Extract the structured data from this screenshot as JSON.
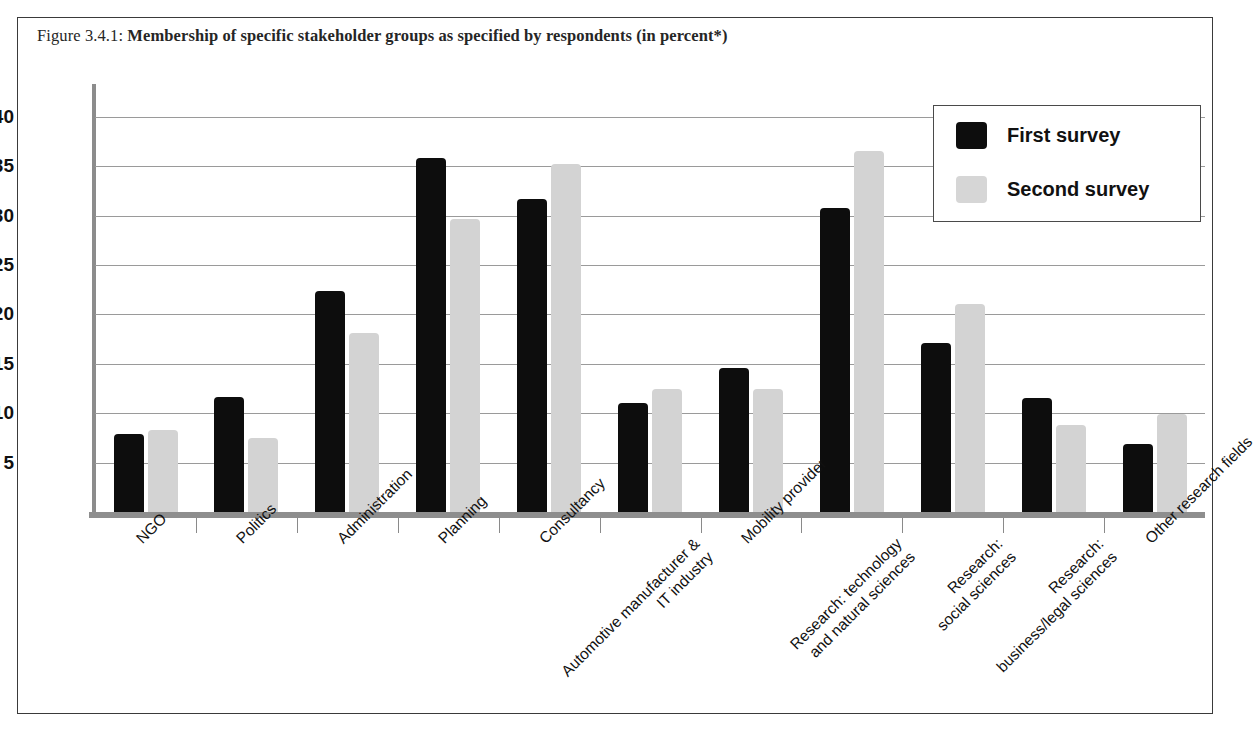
{
  "figure": {
    "caption_prefix": "Figure 3.4.1: ",
    "caption_main": "Membership of specific stakeholder groups as specified by respondents (in percent*)"
  },
  "legend": {
    "position": "top-right",
    "entries": [
      {
        "label": "First survey",
        "color": "#0d0d0d"
      },
      {
        "label": "Second survey",
        "color": "#d6d6d6"
      }
    ]
  },
  "chart_data": {
    "type": "bar",
    "title": "Membership of specific stakeholder groups as specified by respondents (in percent*)",
    "xlabel": "",
    "ylabel": "",
    "ylim": [
      0,
      43
    ],
    "yticks": [
      5,
      10,
      15,
      20,
      25,
      30,
      35,
      40
    ],
    "ytick_labels": [
      "5",
      "10",
      "15",
      "20",
      "25",
      "30",
      "35",
      "40"
    ],
    "grid": true,
    "legend_position": "upper right",
    "categories": [
      "NGO",
      "Politics",
      "Administration",
      "Planning",
      "Consultancy",
      "Automotive manufacturer &\nIT industry",
      "Mobility provider",
      "Research: technology\nand natural sciences",
      "Research:\nsocial sciences",
      "Research:\nbusiness/legal sciences",
      "Other research fields"
    ],
    "category_lines": [
      [
        "NGO"
      ],
      [
        "Politics"
      ],
      [
        "Administration"
      ],
      [
        "Planning"
      ],
      [
        "Consultancy"
      ],
      [
        "Automotive manufacturer &",
        "IT industry"
      ],
      [
        "Mobility provider"
      ],
      [
        "Research: technology",
        "and natural sciences"
      ],
      [
        "Research:",
        "social sciences"
      ],
      [
        "Research:",
        "business/legal sciences"
      ],
      [
        "Other research fields"
      ]
    ],
    "series": [
      {
        "name": "First survey",
        "color": "#0d0d0d",
        "values": [
          7.9,
          11.6,
          22.4,
          35.8,
          31.7,
          11.0,
          14.6,
          30.8,
          17.1,
          11.5,
          6.9
        ]
      },
      {
        "name": "Second survey",
        "color": "#d3d3d3",
        "values": [
          8.3,
          7.5,
          18.1,
          29.7,
          35.2,
          12.4,
          12.4,
          36.5,
          21.1,
          8.8,
          9.9
        ]
      }
    ]
  }
}
